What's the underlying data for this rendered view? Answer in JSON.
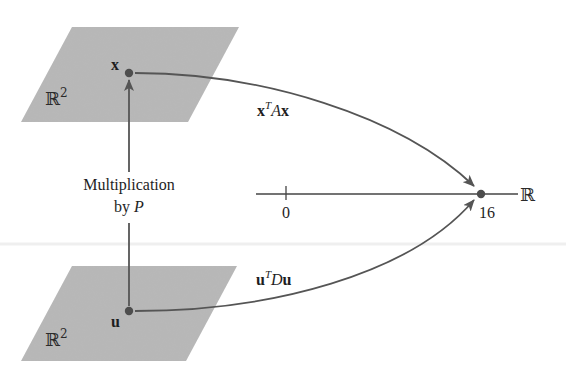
{
  "figure": {
    "top_plane": {
      "space_symbol": "ℝ",
      "space_exponent": "2",
      "point_label": "x"
    },
    "bottom_plane": {
      "space_symbol": "ℝ",
      "space_exponent": "2",
      "point_label": "u"
    },
    "vertical_arrow": {
      "label_line1": "Multiplication",
      "label_line2_prefix": "by ",
      "label_line2_var": "P"
    },
    "upper_map": {
      "vec1": "x",
      "transpose": "T",
      "matrix": "A",
      "vec2": "x"
    },
    "lower_map": {
      "vec1": "u",
      "transpose": "T",
      "matrix": "D",
      "vec2": "u"
    },
    "number_line": {
      "space_symbol": "ℝ",
      "tick_label": "0",
      "point_label": "16"
    }
  },
  "colors": {
    "plane_fill": "#b7b7b7",
    "curve_stroke": "#555555",
    "point_fill": "#4d4d4d",
    "text": "#1e1e1e"
  }
}
